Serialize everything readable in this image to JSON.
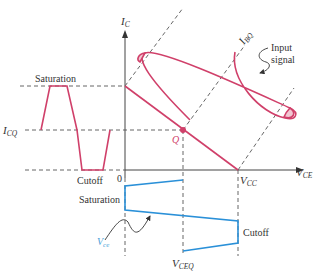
{
  "diagram": {
    "axes": {
      "y_label": "I",
      "y_label_sub": "C",
      "x_label": "V",
      "x_label_sub": "CE",
      "origin": "0"
    },
    "labels": {
      "saturation_top": "Saturation",
      "icq": "I",
      "icq_sub": "CQ",
      "cutoff_left": "Cutoff",
      "ibq": "I",
      "ibq_sub": "BQ",
      "input_signal_line1": "Input",
      "input_signal_line2": "signal",
      "q_point": "Q",
      "vcc": "V",
      "vcc_sub": "CC",
      "saturation_bottom": "Saturation",
      "cutoff_bottom": "Cutoff",
      "vce": "V",
      "vce_sub": "ce",
      "vceq": "V",
      "vceq_sub": "CEQ"
    },
    "colors": {
      "load_line": "#d0406a",
      "output_wave": "#2a90d8",
      "axis": "#444444",
      "dashed": "#555555"
    }
  }
}
